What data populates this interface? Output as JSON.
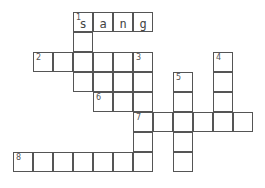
{
  "puzzle": {
    "cell_size": 20,
    "origin_x": 13,
    "origin_y": 12,
    "cells": [
      {
        "c": 3,
        "r": 0,
        "num": "1",
        "letter": "s"
      },
      {
        "c": 4,
        "r": 0,
        "letter": "a"
      },
      {
        "c": 5,
        "r": 0,
        "letter": "n"
      },
      {
        "c": 6,
        "r": 0,
        "letter": "g"
      },
      {
        "c": 3,
        "r": 1
      },
      {
        "c": 1,
        "r": 2,
        "num": "2"
      },
      {
        "c": 2,
        "r": 2
      },
      {
        "c": 3,
        "r": 2
      },
      {
        "c": 4,
        "r": 2
      },
      {
        "c": 5,
        "r": 2
      },
      {
        "c": 6,
        "r": 2,
        "num": "3"
      },
      {
        "c": 10,
        "r": 2,
        "num": "4"
      },
      {
        "c": 3,
        "r": 3
      },
      {
        "c": 4,
        "r": 3
      },
      {
        "c": 5,
        "r": 3
      },
      {
        "c": 6,
        "r": 3
      },
      {
        "c": 8,
        "r": 3,
        "num": "5"
      },
      {
        "c": 10,
        "r": 3
      },
      {
        "c": 4,
        "r": 4,
        "num": "6"
      },
      {
        "c": 5,
        "r": 4
      },
      {
        "c": 6,
        "r": 4
      },
      {
        "c": 8,
        "r": 4
      },
      {
        "c": 10,
        "r": 4
      },
      {
        "c": 6,
        "r": 5,
        "num": "7"
      },
      {
        "c": 7,
        "r": 5
      },
      {
        "c": 8,
        "r": 5
      },
      {
        "c": 9,
        "r": 5
      },
      {
        "c": 10,
        "r": 5
      },
      {
        "c": 11,
        "r": 5
      },
      {
        "c": 6,
        "r": 6
      },
      {
        "c": 8,
        "r": 6
      },
      {
        "c": 0,
        "r": 7,
        "num": "8"
      },
      {
        "c": 1,
        "r": 7
      },
      {
        "c": 2,
        "r": 7
      },
      {
        "c": 3,
        "r": 7
      },
      {
        "c": 4,
        "r": 7
      },
      {
        "c": 5,
        "r": 7
      },
      {
        "c": 6,
        "r": 7
      },
      {
        "c": 8,
        "r": 7
      }
    ]
  }
}
